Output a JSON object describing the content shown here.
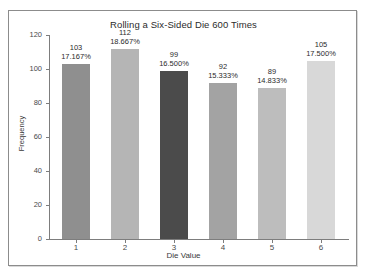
{
  "chart_data": {
    "type": "bar",
    "title": "Rolling a Six-Sided Die 600 Times",
    "xlabel": "Die Value",
    "ylabel": "Frequency",
    "categories": [
      "1",
      "2",
      "3",
      "4",
      "5",
      "6"
    ],
    "values": [
      103,
      112,
      99,
      92,
      89,
      105
    ],
    "percent_labels": [
      "17.167%",
      "18.667%",
      "16.500%",
      "15.333%",
      "14.833%",
      "17.500%"
    ],
    "bar_colors": [
      "#8f8f8f",
      "#b5b5b5",
      "#4b4b4b",
      "#a3a3a3",
      "#bdbdbd",
      "#d8d8d8"
    ],
    "ylim": [
      0,
      120
    ],
    "yticks": [
      0,
      20,
      40,
      60,
      80,
      100,
      120
    ],
    "ytick_labels": [
      "0",
      "20",
      "40",
      "60",
      "80",
      "100",
      "120"
    ],
    "grid": false,
    "legend": "none",
    "total_rolls": 600
  },
  "frame": {
    "border_color": "#8c8c8c",
    "background": "#ffffff"
  }
}
